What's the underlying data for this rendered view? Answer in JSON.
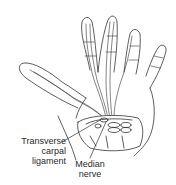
{
  "diagram": {
    "labels": {
      "transverse_carpal_ligament": {
        "line1": "Transverse",
        "line2": "carpal",
        "line3": "ligament"
      },
      "median_nerve": {
        "line1": "Median",
        "line2": "nerve"
      }
    },
    "colors": {
      "stroke": "#333333",
      "fill": "#ffffff",
      "text": "#2a2a2a"
    }
  }
}
